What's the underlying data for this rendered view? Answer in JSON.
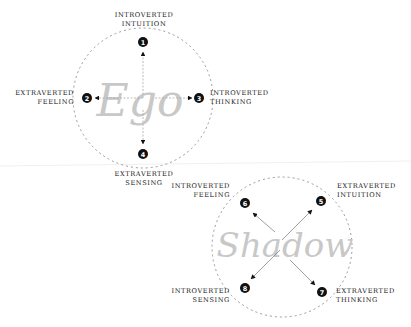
{
  "diagrams": {
    "ego": {
      "watermark": "Ego",
      "functions": [
        {
          "num": "1",
          "line1": "Introverted",
          "line2": "Intuition"
        },
        {
          "num": "2",
          "line1": "Extraverted",
          "line2": "Feeling"
        },
        {
          "num": "3",
          "line1": "Introverted",
          "line2": "Thinking"
        },
        {
          "num": "4",
          "line1": "Extraverted",
          "line2": "Sensing"
        }
      ]
    },
    "shadow": {
      "watermark": "Shadow",
      "functions": [
        {
          "num": "5",
          "line1": "Extraverted",
          "line2": "Intuition"
        },
        {
          "num": "6",
          "line1": "Introverted",
          "line2": "Feeling"
        },
        {
          "num": "7",
          "line1": "Extraverted",
          "line2": "Thinking"
        },
        {
          "num": "8",
          "line1": "Introverted",
          "line2": "Sensing"
        }
      ]
    }
  },
  "colors": {
    "badge": "#111111",
    "circle": "#999999",
    "watermark": "#bbbbbb",
    "text": "#222222"
  }
}
